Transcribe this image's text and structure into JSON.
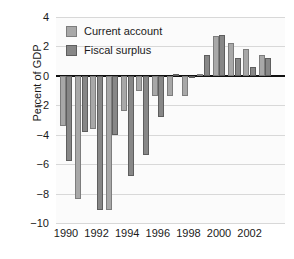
{
  "chart_data": {
    "type": "bar",
    "title": "",
    "xlabel": "",
    "ylabel": "Percent of GDP",
    "ylim": [
      -10,
      4
    ],
    "ytick_values": [
      4,
      2,
      0,
      -2,
      -4,
      -6,
      -8,
      -10
    ],
    "ytick_labels": [
      "4",
      "2",
      "0",
      "−2",
      "−4",
      "−6",
      "−8",
      "−10"
    ],
    "grid": true,
    "grid_axis": "y",
    "legend_position": "top-left",
    "categories": [
      1990,
      1991,
      1992,
      1993,
      1994,
      1995,
      1996,
      1997,
      1998,
      1999,
      2000,
      2001,
      2002,
      2003
    ],
    "xtick_labels": [
      "1990",
      "1992",
      "1994",
      "1996",
      "1998",
      "2000",
      "2002"
    ],
    "xtick_values": [
      1990,
      1992,
      1994,
      1996,
      1998,
      2000,
      2002
    ],
    "series": [
      {
        "name": "Current account",
        "color": "#a8a8a8",
        "values": [
          -3.4,
          -8.4,
          -3.6,
          -9.1,
          -2.4,
          -1.0,
          -1.4,
          -1.4,
          -1.4,
          0.1,
          2.7,
          2.2,
          1.8,
          1.4
        ]
      },
      {
        "name": "Fiscal surplus",
        "color": "#878787",
        "values": [
          -5.8,
          -3.8,
          -9.1,
          -4.0,
          -6.8,
          -5.4,
          -2.8,
          0.1,
          -0.1,
          1.4,
          2.8,
          1.2,
          0.6,
          1.2
        ]
      }
    ]
  },
  "legend": {
    "items": [
      {
        "label": "Current account",
        "color": "#a8a8a8"
      },
      {
        "label": "Fiscal surplus",
        "color": "#878787"
      }
    ]
  },
  "axes": {
    "y_title": "Percent of GDP"
  }
}
